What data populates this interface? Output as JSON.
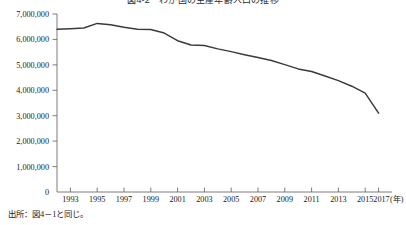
{
  "chart_data": {
    "type": "line",
    "title": "図4-2　わが国の生産年齢人口の推移",
    "xlabel": "(年)",
    "ylabel": "",
    "x": [
      1993,
      1994,
      1995,
      1996,
      1997,
      1998,
      1999,
      2000,
      2001,
      2002,
      2003,
      2004,
      2005,
      2006,
      2007,
      2008,
      2009,
      2010,
      2011,
      2012,
      2013,
      2014,
      2015,
      2016,
      2017
    ],
    "values": [
      6400000,
      6420000,
      6450000,
      6630000,
      6580000,
      6480000,
      6400000,
      6390000,
      6250000,
      5950000,
      5780000,
      5760000,
      5630000,
      5520000,
      5400000,
      5290000,
      5170000,
      5010000,
      4840000,
      4740000,
      4560000,
      4380000,
      4160000,
      3890000,
      3100000
    ],
    "series": [
      {
        "name": "推移",
        "values": [
          6400000,
          6420000,
          6450000,
          6630000,
          6580000,
          6480000,
          6400000,
          6390000,
          6250000,
          5950000,
          5780000,
          5760000,
          5630000,
          5520000,
          5400000,
          5290000,
          5170000,
          5010000,
          4840000,
          4740000,
          4560000,
          4380000,
          4160000,
          3890000,
          3100000
        ],
        "color": "#3a3a3a"
      }
    ],
    "ylim": [
      0,
      7000000
    ],
    "xlim": [
      1993,
      2017
    ],
    "ytick_labels": [
      "7,000,000",
      "6,000,000",
      "5,000,000",
      "4,000,000",
      "3,000,000",
      "2,000,000",
      "1,000,000",
      "0"
    ],
    "ytick_values": [
      7000000,
      6000000,
      5000000,
      4000000,
      3000000,
      2000000,
      1000000,
      0
    ],
    "xtick_labels": [
      "1993",
      "1995",
      "1997",
      "1999",
      "2001",
      "2003",
      "2005",
      "2007",
      "2009",
      "2011",
      "2013",
      "2015",
      "2017"
    ],
    "xtick_values": [
      1993,
      1995,
      1997,
      1999,
      2001,
      2003,
      2005,
      2007,
      2009,
      2011,
      2013,
      2015,
      2017
    ],
    "x_unit": "(年)",
    "grid": false,
    "legend": false
  },
  "source_note": "出所：図4－1と同じ。"
}
